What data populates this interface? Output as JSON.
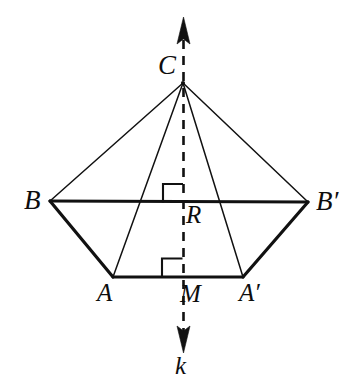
{
  "figure": {
    "type": "geometry-diagram",
    "width": 355,
    "height": 391,
    "background_color": "#ffffff",
    "stroke_color": "#111111"
  },
  "labels": {
    "apex": "C",
    "left_upper": "B",
    "right_upper": "B′",
    "center_upper": "R",
    "left_lower": "A",
    "center_lower": "M",
    "right_lower": "A′",
    "axis": "k"
  },
  "points": {
    "C": {
      "x": 183,
      "y": 83
    },
    "B": {
      "x": 50,
      "y": 201
    },
    "Bp": {
      "x": 308,
      "y": 202
    },
    "A": {
      "x": 113,
      "y": 277
    },
    "Ap": {
      "x": 243,
      "y": 277
    },
    "M": {
      "x": 183,
      "y": 277
    },
    "R": {
      "x": 183,
      "y": 202
    }
  },
  "segments": [
    {
      "name": "B-Bprime",
      "from": "B",
      "to": "Bp",
      "style": "thick"
    },
    {
      "name": "B-A",
      "from": "B",
      "to": "A",
      "style": "thick"
    },
    {
      "name": "A-Aprime",
      "from": "A",
      "to": "Ap",
      "style": "thick"
    },
    {
      "name": "Aprime-Bprime",
      "from": "Ap",
      "to": "Bp",
      "style": "thick"
    },
    {
      "name": "C-B",
      "from": "C",
      "to": "B",
      "style": "thin"
    },
    {
      "name": "C-A",
      "from": "C",
      "to": "A",
      "style": "thin"
    },
    {
      "name": "C-Aprime",
      "from": "C",
      "to": "Ap",
      "style": "thin"
    },
    {
      "name": "C-Bprime",
      "from": "C",
      "to": "Bp",
      "style": "thin"
    }
  ],
  "axis": {
    "label": "k",
    "style": "dashed",
    "x": 183,
    "top_y": 18,
    "bottom_y": 352,
    "arrow_top": true,
    "arrow_bottom": true
  },
  "right_angle_marks": [
    {
      "name": "right-angle-at-R",
      "vertex": "R",
      "x": 163,
      "y": 184,
      "size": 19
    },
    {
      "name": "right-angle-at-M",
      "vertex": "M",
      "x": 162,
      "y": 258,
      "size": 19
    }
  ]
}
